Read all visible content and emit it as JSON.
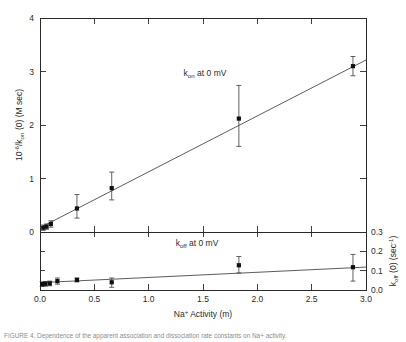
{
  "figure": {
    "caption": "FIGURE 4.  Dependence of the apparent association and dissociation rate constants on Na+ activity."
  },
  "axes": {
    "x": {
      "title_main": "Na",
      "title_sup": "+",
      "title_rest": " Activity  (m)",
      "ticklabels": [
        "0.0",
        "0.5",
        "1.0",
        "1.5",
        "2.0",
        "2.5",
        "3.0"
      ],
      "tickvalues": [
        0.0,
        0.5,
        1.0,
        1.5,
        2.0,
        2.5,
        3.0
      ],
      "range": [
        0.0,
        3.0
      ]
    },
    "y_upper": {
      "title_pre": "10",
      "title_sup": "-6",
      "title_mid": "/k",
      "title_sub": "on",
      "title_post": " (0)  (M sec)",
      "ticklabels": [
        "0",
        "1",
        "2",
        "3",
        "4"
      ],
      "tickvalues": [
        0,
        1,
        2,
        3,
        4
      ],
      "range": [
        0,
        4
      ]
    },
    "y_lower": {
      "title_pre": "k",
      "title_sub": "off",
      "title_mid": " (0)  (sec",
      "title_sup": "-1",
      "title_post": ")",
      "ticklabels": [
        "0.0",
        "0.1",
        "0.2",
        "0.3"
      ],
      "tickvalues": [
        0.0,
        0.1,
        0.2,
        0.3
      ],
      "range": [
        0.0,
        0.3
      ]
    }
  },
  "annotations": {
    "upper": {
      "pre": "k",
      "sub": "on",
      "post": " at 0 mV"
    },
    "lower": {
      "pre": "k",
      "sub": "off",
      "post": " at 0 mV"
    }
  },
  "chart_data": [
    {
      "type": "scatter",
      "title": "k_on at 0 mV",
      "panel": "upper",
      "xlabel": "Na+ Activity (m)",
      "ylabel": "10^-6 / k_on (0) (M sec)",
      "xlim": [
        0.0,
        3.0
      ],
      "ylim": [
        0,
        4
      ],
      "grid": false,
      "legend": "none",
      "series": [
        {
          "name": "10^-6/k_on(0)",
          "marker": "filled-square",
          "x": [
            0.03,
            0.06,
            0.1,
            0.34,
            0.66,
            1.83,
            2.88
          ],
          "y": [
            0.08,
            0.1,
            0.15,
            0.44,
            0.82,
            2.12,
            3.1
          ],
          "yerr_low": [
            0.05,
            0.05,
            0.06,
            0.18,
            0.22,
            0.52,
            0.18
          ],
          "yerr_high": [
            0.05,
            0.05,
            0.06,
            0.26,
            0.3,
            0.62,
            0.18
          ]
        }
      ],
      "fit": {
        "type": "line",
        "intercept": 0.08,
        "slope": 1.045
      }
    },
    {
      "type": "scatter",
      "title": "k_off at 0 mV",
      "panel": "lower",
      "xlabel": "Na+ Activity (m)",
      "ylabel": "k_off (0) (sec^-1)",
      "xlim": [
        0.0,
        3.0
      ],
      "ylim": [
        0.0,
        0.3
      ],
      "grid": false,
      "legend": "none",
      "series": [
        {
          "name": "k_off(0)",
          "marker": "filled-square",
          "x": [
            0.02,
            0.05,
            0.09,
            0.16,
            0.34,
            0.66,
            1.83,
            2.88
          ],
          "y": [
            0.03,
            0.032,
            0.034,
            0.046,
            0.052,
            0.04,
            0.128,
            0.118
          ],
          "yerr_low": [
            0.012,
            0.012,
            0.012,
            0.016,
            0.01,
            0.026,
            0.04,
            0.072
          ],
          "yerr_high": [
            0.012,
            0.012,
            0.012,
            0.016,
            0.01,
            0.022,
            0.045,
            0.066
          ]
        }
      ],
      "fit": {
        "type": "line",
        "intercept": 0.038,
        "slope": 0.0268
      }
    }
  ]
}
